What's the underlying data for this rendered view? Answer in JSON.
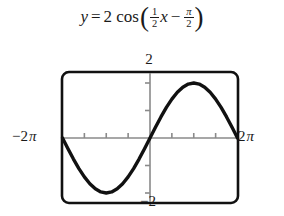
{
  "equation": {
    "lhs": "y",
    "equals": "=",
    "amplitude": "2",
    "function": "cos",
    "open_paren": "(",
    "b_numerator": "1",
    "b_denominator": "2",
    "x_var": "x",
    "minus": "−",
    "phase_numerator": "π",
    "phase_denominator": "2",
    "close_paren": ")",
    "plain": "y = 2 cos((1/2)x − π/2)"
  },
  "graph": {
    "y_max_label": "2",
    "y_min_label": "−2",
    "x_min_label_minus": "−",
    "x_min_label_number": "2",
    "x_min_label_pi": "π",
    "x_max_label_number": "2",
    "x_max_label_pi": "π",
    "curve_color": "#111111",
    "axis_color": "#8a8a8a",
    "frame_color": "#111111",
    "background_color": "#ffffff"
  },
  "chart_data": {
    "type": "line",
    "xlabel": "",
    "ylabel": "",
    "xlim": [
      -6.283185,
      6.283185
    ],
    "ylim": [
      -2.4,
      2.4
    ],
    "xtick_labels": [
      "−2π",
      "2π"
    ],
    "ytick_labels": [
      "2",
      "−2"
    ],
    "xticks": [
      -6.283185,
      -4.712389,
      -3.141593,
      -1.570796,
      0,
      1.570796,
      3.141593,
      4.712389,
      6.283185
    ],
    "yticks": [
      -2,
      -1,
      0,
      1,
      2
    ],
    "grid": false,
    "legend": false,
    "series": [
      {
        "name": "y = 2 cos(x/2 − π/2)",
        "x": [
          -6.283185,
          -5.890486,
          -5.497787,
          -5.105088,
          -4.712389,
          -4.31969,
          -3.926991,
          -3.534292,
          -3.141593,
          -2.748894,
          -2.356194,
          -1.963495,
          -1.570796,
          -1.178097,
          -0.785398,
          -0.392699,
          0,
          0.392699,
          0.785398,
          1.178097,
          1.570796,
          1.963495,
          2.356194,
          2.748894,
          3.141593,
          3.534292,
          3.926991,
          4.31969,
          4.712389,
          5.105088,
          5.497787,
          5.890486,
          6.283185
        ],
        "y": [
          0,
          -0.390181,
          -0.765367,
          -1.11114,
          -1.414214,
          -1.662939,
          -1.847759,
          -1.961571,
          -2,
          -1.961571,
          -1.847759,
          -1.662939,
          -1.414214,
          -1.11114,
          -0.765367,
          -0.390181,
          0,
          0.390181,
          0.765367,
          1.11114,
          1.414214,
          1.662939,
          1.847759,
          1.961571,
          2,
          1.961571,
          1.847759,
          1.662939,
          1.414214,
          1.11114,
          0.765367,
          0.390181,
          0
        ]
      }
    ],
    "key_points": {
      "minimum": {
        "x": -3.141593,
        "y": -2
      },
      "maximum": {
        "x": 3.141593,
        "y": 2
      },
      "zeros": [
        -6.283185,
        0,
        6.283185
      ]
    }
  }
}
